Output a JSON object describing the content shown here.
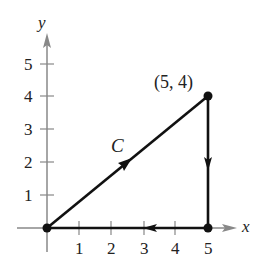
{
  "axes": {
    "x_label": "x",
    "y_label": "y",
    "x_ticks": [
      "1",
      "2",
      "3",
      "4",
      "5"
    ],
    "y_ticks": [
      "1",
      "2",
      "3",
      "4",
      "5"
    ],
    "axis_color": "#888888"
  },
  "curve": {
    "name": "C",
    "color": "#111111",
    "vertices": [
      [
        0,
        0
      ],
      [
        5,
        4
      ],
      [
        5,
        0
      ],
      [
        0,
        0
      ]
    ],
    "point_label": "(5, 4)"
  }
}
